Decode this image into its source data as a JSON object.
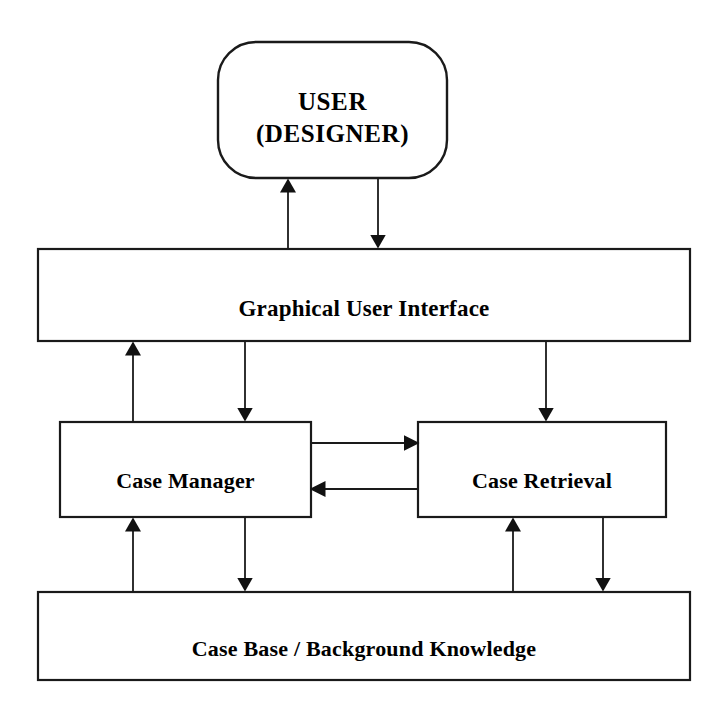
{
  "diagram": {
    "type": "block-architecture-flow-diagram",
    "background_color": "#ffffff",
    "stroke_color": "#1a1a1a",
    "nodes": [
      {
        "id": "user",
        "label": "USER\n(DESIGNER)",
        "shape": "rounded-rectangle",
        "x": 218,
        "y": 42,
        "w": 229,
        "h": 136
      },
      {
        "id": "gui",
        "label": "Graphical User Interface",
        "shape": "rectangle",
        "x": 38,
        "y": 249,
        "w": 652,
        "h": 92
      },
      {
        "id": "case_manager",
        "label": "Case Manager",
        "shape": "rectangle",
        "x": 60,
        "y": 422,
        "w": 251,
        "h": 95
      },
      {
        "id": "case_retrieval",
        "label": "Case Retrieval",
        "shape": "rectangle",
        "x": 418,
        "y": 422,
        "w": 248,
        "h": 95
      },
      {
        "id": "case_base",
        "label": "Case Base / Background Knowledge",
        "shape": "rectangle",
        "x": 38,
        "y": 592,
        "w": 652,
        "h": 88
      }
    ],
    "edges": [
      {
        "id": "e1",
        "name": "gui-to-user",
        "from": "gui",
        "to": "user",
        "direction": "up",
        "x": 288,
        "y1": 249,
        "y2": 178
      },
      {
        "id": "e2",
        "name": "user-to-gui",
        "from": "user",
        "to": "gui",
        "direction": "down",
        "x": 378,
        "y1": 178,
        "y2": 249
      },
      {
        "id": "e3",
        "name": "case-manager-to-gui",
        "from": "case_manager",
        "to": "gui",
        "direction": "up",
        "x": 133,
        "y1": 422,
        "y2": 341
      },
      {
        "id": "e4",
        "name": "gui-to-case-manager",
        "from": "gui",
        "to": "case_manager",
        "direction": "down",
        "x": 245,
        "y1": 341,
        "y2": 422
      },
      {
        "id": "e5",
        "name": "gui-to-case-retrieval",
        "from": "gui",
        "to": "case_retrieval",
        "direction": "down",
        "x": 546,
        "y1": 341,
        "y2": 422
      },
      {
        "id": "e6",
        "name": "case-manager-to-case-retrieval",
        "from": "case_manager",
        "to": "case_retrieval",
        "direction": "right",
        "y": 443,
        "x1": 311,
        "x2": 418
      },
      {
        "id": "e7",
        "name": "case-retrieval-to-case-manager",
        "from": "case_retrieval",
        "to": "case_manager",
        "direction": "left",
        "y": 489,
        "x1": 418,
        "x2": 311
      },
      {
        "id": "e8",
        "name": "case-base-to-case-manager",
        "from": "case_base",
        "to": "case_manager",
        "direction": "up",
        "x": 133,
        "y1": 592,
        "y2": 517
      },
      {
        "id": "e9",
        "name": "case-manager-to-case-base",
        "from": "case_manager",
        "to": "case_base",
        "direction": "down",
        "x": 245,
        "y1": 517,
        "y2": 592
      },
      {
        "id": "e10",
        "name": "case-base-to-case-retrieval",
        "from": "case_base",
        "to": "case_retrieval",
        "direction": "up",
        "x": 513,
        "y1": 592,
        "y2": 517
      },
      {
        "id": "e11",
        "name": "case-retrieval-to-case-base",
        "from": "case_retrieval",
        "to": "case_base",
        "direction": "down",
        "x": 603,
        "y1": 517,
        "y2": 592
      }
    ]
  }
}
